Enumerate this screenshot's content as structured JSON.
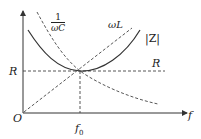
{
  "diagram": {
    "type": "series RLC impedance vs frequency",
    "axes": {
      "origin_label": "O",
      "x_label": "f",
      "x_tick_label": "f",
      "x_tick_sub": "0",
      "y_tick_label": "R"
    },
    "curves": [
      {
        "name": "capacitive reactance",
        "label_num": "1",
        "label_den": "ωC",
        "style": "dashed"
      },
      {
        "name": "inductive reactance",
        "label": "ωL",
        "style": "dashed"
      },
      {
        "name": "impedance magnitude",
        "label": "|Z|",
        "style": "solid"
      },
      {
        "name": "resistance",
        "label": "R",
        "style": "dashed"
      }
    ],
    "colors": {
      "line": "#333333",
      "background": "#ffffff"
    }
  }
}
